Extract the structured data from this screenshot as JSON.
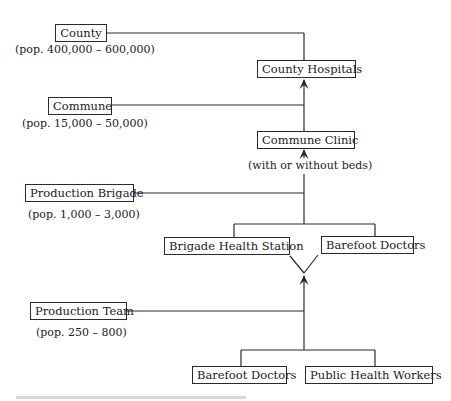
{
  "diagram": {
    "type": "hierarchy-flow",
    "levels": [
      {
        "id": "county",
        "label": "County",
        "population": "(pop. 400,000 – 600,000)",
        "facility": [
          "County Hospitals"
        ]
      },
      {
        "id": "commune",
        "label": "Commune",
        "population": "(pop. 15,000 – 50,000)",
        "facility": [
          "Commune Clinic"
        ],
        "facility_note": "(with or without beds)"
      },
      {
        "id": "brigade",
        "label": "Production Brigade",
        "population": "(pop. 1,000 – 3,000)",
        "facility": [
          "Brigade Health Station",
          "Barefoot Doctors"
        ]
      },
      {
        "id": "team",
        "label": "Production Team",
        "population": "(pop. 250 – 800)",
        "facility": [
          "Barefoot Doctors",
          "Public Health Workers"
        ]
      }
    ],
    "edges": [
      {
        "from": "Commune Clinic",
        "to": "County Hospitals",
        "arrow": true
      },
      {
        "from": "Brigade level",
        "to": "Commune Clinic",
        "arrow": true
      },
      {
        "from": "Team level",
        "to": "Brigade level",
        "arrow": true
      }
    ],
    "line_color": "#2a2a2a"
  }
}
